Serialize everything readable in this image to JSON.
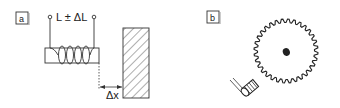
{
  "panels": [
    {
      "tag": "a",
      "formula": "L ± ΔL",
      "distance_label": "Δx"
    },
    {
      "tag": "b"
    }
  ]
}
